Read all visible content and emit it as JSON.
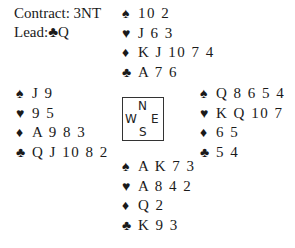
{
  "contract": {
    "label": "Contract:",
    "value": "3NT"
  },
  "lead": {
    "label": "Lead:",
    "suit": "♣",
    "card": "Q"
  },
  "compass": {
    "north": "N",
    "south": "S",
    "east": "E",
    "west": "W"
  },
  "hands": {
    "north": {
      "spades": "10 2",
      "hearts": "J 6 3",
      "diamonds": "K J 10 7 4",
      "clubs": "A 7 6"
    },
    "west": {
      "spades": "J 9",
      "hearts": "9 5",
      "diamonds": "A 9 8 3",
      "clubs": "Q J 10 8 2"
    },
    "east": {
      "spades": "Q 8 6 5 4",
      "hearts": "K Q 10 7",
      "diamonds": "6 5",
      "clubs": "5 4"
    },
    "south": {
      "spades": "A K 7 3",
      "hearts": "A 8 4 2",
      "diamonds": "Q 2",
      "clubs": "K 9 3"
    }
  },
  "suits": {
    "spades": "♠",
    "hearts": "♥",
    "diamonds": "♦",
    "clubs": "♣"
  }
}
